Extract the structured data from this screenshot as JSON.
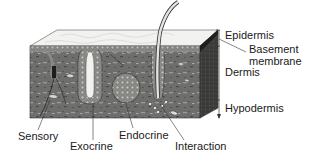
{
  "diagram": {
    "colors": {
      "background": "#ffffff",
      "epidermis_top": "#f2f2f0",
      "dermis": "#6e6e6c",
      "dermis_dark": "#4a4a48",
      "side_face": "#3c3c3a",
      "gland": "#b8b8b4",
      "label_text": "#1a1a1a",
      "line": "#333333"
    },
    "layer_labels": {
      "epidermis": "Epidermis",
      "basement_membrane_line1": "Basement",
      "basement_membrane_line2": "membrane",
      "dermis": "Dermis",
      "hypodermis": "Hypodermis"
    },
    "structure_labels": {
      "sensory": "Sensory",
      "exocrine": "Exocrine",
      "endocrine": "Endocrine",
      "interaction": "Interaction"
    }
  }
}
